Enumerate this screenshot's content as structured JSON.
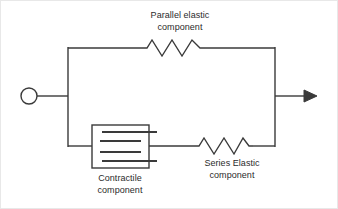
{
  "diagram": {
    "stroke_color": "#3a3a3a",
    "text_color": "#2b2b2b",
    "background_color": "#ffffff",
    "labels": {
      "parallel_elastic": "Parallel elastic\ncomponent",
      "parallel_elastic_line1": "Parallel elastic",
      "parallel_elastic_line2": "component",
      "series_elastic_line1": "Series Elastic",
      "series_elastic_line2": "component",
      "contractile_line1": "Contractile",
      "contractile_line2": "component"
    },
    "elements": {
      "input_terminal": "circle-terminal",
      "output_terminal": "arrow-terminal",
      "parallel_elastic_symbol": "zigzag-spring",
      "series_elastic_symbol": "zigzag-spring",
      "contractile_symbol": "box-with-parallel-lines"
    },
    "geometry": {
      "left_node_x": 67,
      "right_node_x": 274,
      "top_branch_y": 47,
      "bottom_branch_y": 145,
      "main_axis_y": 95,
      "circle_cx": 28,
      "circle_cy": 95,
      "circle_r": 8,
      "arrow_tip_x": 311
    }
  }
}
